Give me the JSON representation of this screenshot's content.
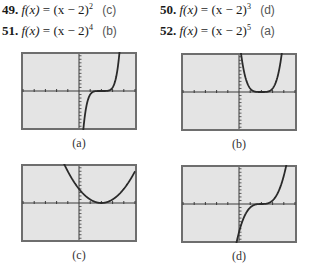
{
  "exercises": [
    {
      "number": "49.",
      "lhs": "f(x)",
      "expr_base": "(x − 2)",
      "exponent": "2",
      "answer": "(c)"
    },
    {
      "number": "50.",
      "lhs": "f(x)",
      "expr_base": "(x − 2)",
      "exponent": "3",
      "answer": "(d)"
    },
    {
      "number": "51.",
      "lhs": "f(x)",
      "expr_base": "(x − 2)",
      "exponent": "4",
      "answer": "(b)"
    },
    {
      "number": "52.",
      "lhs": "f(x)",
      "expr_base": "(x − 2)",
      "exponent": "5",
      "answer": "(a)"
    }
  ],
  "graphs": [
    {
      "label": "(a)",
      "function": "(x-2)^5",
      "exponent": 5
    },
    {
      "label": "(b)",
      "function": "(x-2)^4",
      "exponent": 4
    },
    {
      "label": "(c)",
      "function": "(x-2)^2",
      "exponent": 2
    },
    {
      "label": "(d)",
      "function": "(x-2)^3",
      "exponent": 3
    }
  ],
  "window": {
    "xmin": -5,
    "xmax": 5,
    "xscl": 1,
    "ymin": -10.5,
    "ymax": 10.5,
    "yscl": 1
  },
  "colors": {
    "screen_bg": "#e4e4e4",
    "border": "#6e6e6e",
    "axis": "#3a3a3a",
    "curve": "#2a2a2a"
  }
}
